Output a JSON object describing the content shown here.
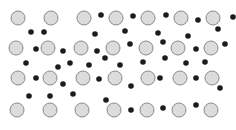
{
  "figure": {
    "title": "",
    "caption": "",
    "width": 236,
    "height": 130,
    "background_color": "#ffffff"
  },
  "legend": {
    "large_particle_label": "",
    "small_particle_label": ""
  },
  "chart_data": {
    "type": "scatter",
    "title": "",
    "subtitle": "",
    "xlabel": "",
    "ylabel": "",
    "xlim": [
      0,
      236
    ],
    "ylim": [
      0,
      130
    ],
    "grid": false,
    "legend_position": "none",
    "axes_visible": false,
    "tick_labels_x": [],
    "tick_labels_y": [],
    "annotations": [],
    "series": [
      {
        "name": "large-particle",
        "marker": "circle",
        "radius": 7,
        "fill_color": "#dcdcdc",
        "stroke_color": "#8a8a8a",
        "stroke_width": 1,
        "count": 29,
        "points": [
          {
            "x": 18,
            "y": 18
          },
          {
            "x": 51,
            "y": 18
          },
          {
            "x": 84,
            "y": 18
          },
          {
            "x": 116,
            "y": 18
          },
          {
            "x": 148,
            "y": 18
          },
          {
            "x": 181,
            "y": 18
          },
          {
            "x": 213,
            "y": 18
          },
          {
            "x": 16,
            "y": 48
          },
          {
            "x": 48,
            "y": 48
          },
          {
            "x": 81,
            "y": 48
          },
          {
            "x": 113,
            "y": 48
          },
          {
            "x": 146,
            "y": 48
          },
          {
            "x": 178,
            "y": 48
          },
          {
            "x": 211,
            "y": 48
          },
          {
            "x": 18,
            "y": 78
          },
          {
            "x": 50,
            "y": 78
          },
          {
            "x": 83,
            "y": 78
          },
          {
            "x": 115,
            "y": 78
          },
          {
            "x": 148,
            "y": 78
          },
          {
            "x": 180,
            "y": 78
          },
          {
            "x": 212,
            "y": 78
          },
          {
            "x": 17,
            "y": 110
          },
          {
            "x": 50,
            "y": 110
          },
          {
            "x": 82,
            "y": 110
          },
          {
            "x": 114,
            "y": 110
          },
          {
            "x": 147,
            "y": 110
          },
          {
            "x": 179,
            "y": 110
          },
          {
            "x": 211,
            "y": 110
          }
        ]
      },
      {
        "name": "small-particle",
        "marker": "circle",
        "radius": 2.8,
        "fill_color": "#1c1c1c",
        "stroke_color": "none",
        "stroke_width": 0,
        "count": 43,
        "points": [
          {
            "x": 101,
            "y": 15
          },
          {
            "x": 133,
            "y": 16
          },
          {
            "x": 166,
            "y": 15
          },
          {
            "x": 198,
            "y": 20
          },
          {
            "x": 233,
            "y": 17
          },
          {
            "x": 31,
            "y": 32
          },
          {
            "x": 44,
            "y": 32
          },
          {
            "x": 95,
            "y": 34
          },
          {
            "x": 125,
            "y": 31
          },
          {
            "x": 158,
            "y": 33
          },
          {
            "x": 188,
            "y": 36
          },
          {
            "x": 218,
            "y": 29
          },
          {
            "x": 36,
            "y": 49
          },
          {
            "x": 63,
            "y": 51
          },
          {
            "x": 97,
            "y": 51
          },
          {
            "x": 130,
            "y": 44
          },
          {
            "x": 163,
            "y": 42
          },
          {
            "x": 196,
            "y": 49
          },
          {
            "x": 225,
            "y": 44
          },
          {
            "x": 26,
            "y": 63
          },
          {
            "x": 58,
            "y": 67
          },
          {
            "x": 70,
            "y": 63
          },
          {
            "x": 89,
            "y": 65
          },
          {
            "x": 105,
            "y": 58
          },
          {
            "x": 120,
            "y": 65
          },
          {
            "x": 143,
            "y": 62
          },
          {
            "x": 165,
            "y": 58
          },
          {
            "x": 186,
            "y": 63
          },
          {
            "x": 205,
            "y": 62
          },
          {
            "x": 36,
            "y": 78
          },
          {
            "x": 63,
            "y": 84
          },
          {
            "x": 99,
            "y": 79
          },
          {
            "x": 131,
            "y": 86
          },
          {
            "x": 160,
            "y": 78
          },
          {
            "x": 196,
            "y": 78
          },
          {
            "x": 220,
            "y": 88
          },
          {
            "x": 29,
            "y": 96
          },
          {
            "x": 50,
            "y": 96
          },
          {
            "x": 73,
            "y": 94
          },
          {
            "x": 106,
            "y": 100
          },
          {
            "x": 131,
            "y": 110
          },
          {
            "x": 163,
            "y": 108
          },
          {
            "x": 196,
            "y": 105
          }
        ]
      }
    ]
  }
}
